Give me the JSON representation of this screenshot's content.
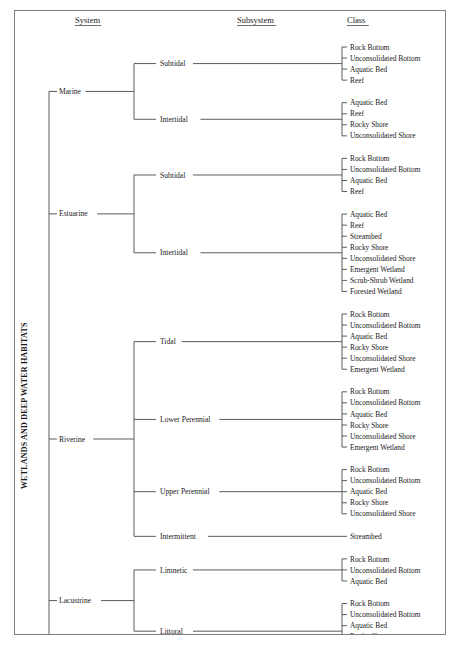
{
  "figure": {
    "vertical_title": "WETLANDS AND DEEP WATER HABITATS",
    "columns": [
      {
        "key": "system",
        "label": "System"
      },
      {
        "key": "subsystem",
        "label": "Subsystem"
      },
      {
        "key": "class",
        "label": "Class"
      }
    ]
  },
  "systems": [
    {
      "name": "Marine",
      "subsystems": [
        {
          "name": "Subtidal",
          "classes": [
            "Rock Bottom",
            "Unconsolidated Bottom",
            "Aquatic Bed",
            "Reef"
          ]
        },
        {
          "name": "Intertidal",
          "classes": [
            "Aquatic Bed",
            "Reef",
            "Rocky Shore",
            "Unconsolidated Shore"
          ]
        }
      ]
    },
    {
      "name": "Estuarine",
      "subsystems": [
        {
          "name": "Subtidal",
          "classes": [
            "Rock Bottom",
            "Unconsolidated Bottom",
            "Aquatic Bed",
            "Reef"
          ]
        },
        {
          "name": "Intertidal",
          "classes": [
            "Aquatic Bed",
            "Reef",
            "Streambed",
            "Rocky Shore",
            "Unconsolidated Shore",
            "Emergent Wetland",
            "Scrub-Shrub Wetland",
            "Forested Wetland"
          ]
        }
      ]
    },
    {
      "name": "Riverine",
      "subsystems": [
        {
          "name": "Tidal",
          "classes": [
            "Rock Bottom",
            "Unconsolidated Bottom",
            "Aquatic Bed",
            "Rocky Shore",
            "Unconsolidated Shore",
            "Emergent Wetland"
          ]
        },
        {
          "name": "Lower Perennial",
          "classes": [
            "Rock Bottom",
            "Unconsolidated Bottom",
            "Aquatic Bed",
            "Rocky Shore",
            "Unconsolidated Shore",
            "Emergent Wetland"
          ]
        },
        {
          "name": "Upper Perennial",
          "classes": [
            "Rock Bottom",
            "Unconsolidated Bottom",
            "Aquatic Bed",
            "Rocky Shore",
            "Unconsolidated Shore"
          ]
        },
        {
          "name": "Intermittent",
          "classes": [
            "Streambed"
          ]
        }
      ]
    },
    {
      "name": "Lacustrine",
      "subsystems": [
        {
          "name": "Limnetic",
          "classes": [
            "Rock Bottom",
            "Unconsolidated Bottom",
            "Aquatic Bed"
          ]
        },
        {
          "name": "Littoral",
          "classes": [
            "Rock Bottom",
            "Unconsolidated Bottom",
            "Aquatic Bed",
            "Rocky Shore",
            "Unconsolidated Shore",
            "Emergent Wetland"
          ]
        }
      ]
    },
    {
      "name": "Palustrine",
      "subsystems": [
        {
          "name": "",
          "classes": [
            "Rock Bottom",
            "Unconsolidated Bottom",
            "Aquatic Bed",
            "Unconsolidated Shore",
            "Moss-Lichen Wetland",
            "Emergent Wetland",
            "Scrub-Shrub Wetland",
            "Forested Wetland"
          ]
        }
      ]
    }
  ]
}
